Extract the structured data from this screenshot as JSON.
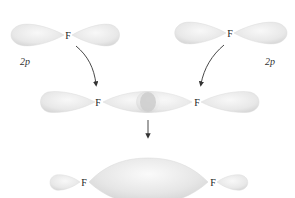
{
  "diagram": {
    "type": "molecular-orbital-formation",
    "colors": {
      "lobe_fill": "#e6e6e6",
      "lobe_edge": "#d4d4d4",
      "overlap_fill": "#cfcfcf",
      "arrow": "#333333",
      "text": "#222222"
    },
    "top_row": {
      "left_atom": {
        "label": "F",
        "orbital_label": "2p"
      },
      "right_atom": {
        "label": "F",
        "orbital_label": "2p"
      }
    },
    "middle_row": {
      "left_atom": {
        "label": "F"
      },
      "right_atom": {
        "label": "F"
      },
      "overlap_region": "end-on overlap of two 2p orbitals"
    },
    "bottom_row": {
      "left_atom": {
        "label": "F"
      },
      "right_atom": {
        "label": "F"
      },
      "bond_lobe": "sigma bonding orbital"
    },
    "arrows": [
      {
        "from": "top-left-orbital",
        "to": "middle-row",
        "style": "curved"
      },
      {
        "from": "top-right-orbital",
        "to": "middle-row",
        "style": "curved"
      },
      {
        "from": "middle-row",
        "to": "bottom-row",
        "style": "straight"
      }
    ]
  }
}
